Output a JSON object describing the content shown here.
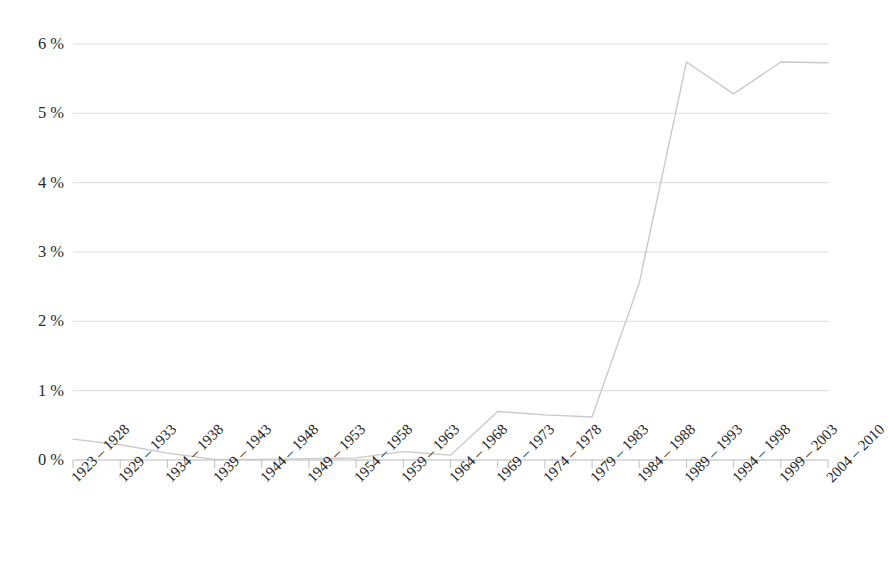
{
  "caption": {
    "clipped_top_text": ""
  },
  "chart_data": {
    "type": "line",
    "title": "",
    "subtitle": "",
    "xlabel": "",
    "ylabel": "",
    "ylim": [
      0,
      6
    ],
    "yticks": [
      0,
      1,
      2,
      3,
      4,
      5,
      6
    ],
    "ytick_labels": [
      "0 %",
      "1 %",
      "2 %",
      "3 %",
      "4 %",
      "5 %",
      "6 %"
    ],
    "grid": true,
    "legend": "none",
    "legend_position": "none",
    "line_color": "#c9c9c9",
    "axis_color": "#b8b8b8",
    "text_color": "#1f1f1f",
    "categories": [
      "1923 – 1928",
      "1929 – 1933",
      "1934 – 1938",
      "1939 – 1943",
      "1944 – 1948",
      "1949 – 1953",
      "1954 – 1958",
      "1959 – 1963",
      "1964 – 1968",
      "1969 – 1973",
      "1974 – 1978",
      "1979 – 1983",
      "1984 – 1988",
      "1989 – 1993",
      "1994 – 1998",
      "1999 – 2003",
      "2004 – 2010"
    ],
    "values": [
      0.3,
      0.22,
      0.1,
      0.01,
      0.01,
      0.02,
      0.03,
      0.12,
      0.07,
      0.7,
      0.65,
      0.62,
      2.55,
      5.74,
      5.28,
      5.74,
      5.73
    ],
    "series": [
      {
        "name": "",
        "values": [
          0.3,
          0.22,
          0.1,
          0.01,
          0.01,
          0.02,
          0.03,
          0.12,
          0.07,
          0.7,
          0.65,
          0.62,
          2.55,
          5.74,
          5.28,
          5.74,
          5.73
        ]
      }
    ]
  },
  "plot_geometry": {
    "left": 73,
    "right": 828,
    "top_value_y": 44,
    "baseline_y": 460,
    "tick_length": 8
  }
}
